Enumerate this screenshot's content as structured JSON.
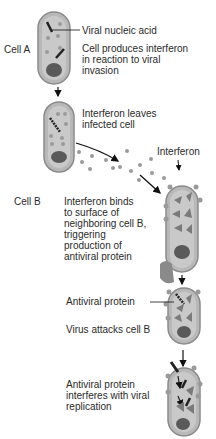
{
  "diagram": {
    "colors": {
      "cell_outline": "#8a8a8a",
      "cell_fill": "#b8b8b8",
      "cell_inner": "#c9c9c9",
      "nucleus": "#5a5a5a",
      "interferon_dot": "#9a9a9a",
      "antiviral_protein": "#7a7a7a",
      "arrow": "#111111"
    },
    "cells": {
      "cell_a_label": "Cell A",
      "cell_b_label": "Cell B"
    },
    "labels": {
      "viral_nucleic_acid": "Viral nucleic acid",
      "produces_l1": "Cell produces interferon",
      "produces_l2": "in reaction to viral",
      "produces_l3": "invasion",
      "leaves_l1": "Interferon leaves",
      "leaves_l2": "infected cell",
      "interferon": "Interferon",
      "binds_l1": "Interferon binds",
      "binds_l2": "to surface of",
      "binds_l3": "neighboring cell B,",
      "binds_l4": "triggering",
      "binds_l5": "production of",
      "binds_l6": "antiviral protein",
      "antiviral_protein": "Antiviral protein",
      "virus_attacks": "Virus attacks cell B",
      "interferes_l1": "Antiviral protein",
      "interferes_l2": "interferes with viral",
      "interferes_l3": "replication"
    }
  }
}
